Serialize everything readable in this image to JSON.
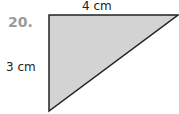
{
  "problem": {
    "number": "20.",
    "shape": "right-triangle",
    "fill": "#d3d3d3",
    "stroke": "#222222",
    "labels": {
      "top": "4 cm",
      "left": "3 cm"
    }
  }
}
